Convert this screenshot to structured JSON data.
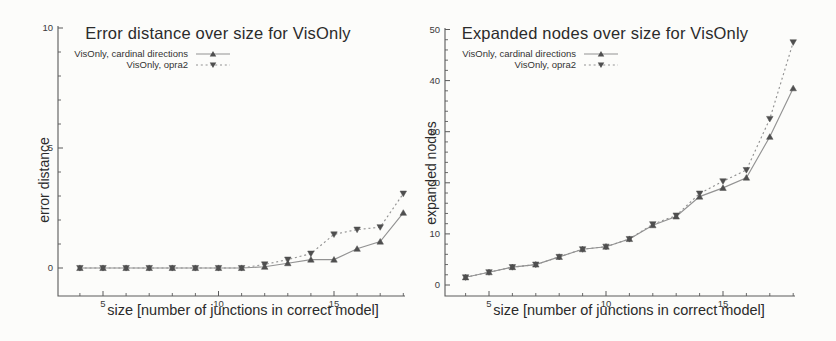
{
  "page": {
    "background_color": "#fcfcfa",
    "axis_color": "#5a5a5a",
    "tick_label_color": "#3a3a3a"
  },
  "chart_data": [
    {
      "type": "line",
      "title": "Error distance over size for VisOnly",
      "xlabel": "size [number of junctions in correct model]",
      "ylabel": "error distance",
      "x": [
        4,
        5,
        6,
        7,
        8,
        9,
        10,
        11,
        12,
        13,
        14,
        15,
        16,
        17,
        18
      ],
      "series": [
        {
          "name": "VisOnly, cardinal directions",
          "line": "solid",
          "marker": "triangle-down",
          "values": [
            0,
            0,
            0,
            0,
            0,
            0,
            0,
            0,
            0.05,
            0.2,
            0.35,
            0.35,
            0.8,
            1.1,
            2.3
          ]
        },
        {
          "name": "VisOnly, opra2",
          "line": "dotted",
          "marker": "triangle-up",
          "values": [
            0,
            0,
            0,
            0,
            0,
            0,
            0,
            0,
            0.15,
            0.35,
            0.6,
            1.4,
            1.6,
            1.7,
            3.1
          ]
        }
      ],
      "xlim": [
        3,
        18.2
      ],
      "ylim": [
        0,
        10
      ],
      "xticks": [
        5,
        10,
        15
      ],
      "yticks": [
        0,
        5,
        10
      ],
      "x_minor_step": 1,
      "y_minor_step": 1,
      "grid": false,
      "legend_position": "top-left-inside",
      "line_color": "#929292",
      "marker_color": "#4f4f4f"
    },
    {
      "type": "line",
      "title": "Expanded nodes over size for VisOnly",
      "xlabel": "size [number of junctions in correct model]",
      "ylabel": "expanded nodes",
      "x": [
        4,
        5,
        6,
        7,
        8,
        9,
        10,
        11,
        12,
        13,
        14,
        15,
        16,
        17,
        18
      ],
      "series": [
        {
          "name": "VisOnly, cardinal directions",
          "line": "solid",
          "marker": "triangle-down",
          "values": [
            1.5,
            2.5,
            3.5,
            4.0,
            5.5,
            7.0,
            7.5,
            9.0,
            11.7,
            13.4,
            17.3,
            19.0,
            21.0,
            29.0,
            38.5
          ]
        },
        {
          "name": "VisOnly, opra2",
          "line": "dotted",
          "marker": "triangle-up",
          "values": [
            1.5,
            2.5,
            3.5,
            4.0,
            5.5,
            7.0,
            7.5,
            9.0,
            11.9,
            13.6,
            17.9,
            20.3,
            22.5,
            32.5,
            47.5
          ]
        }
      ],
      "xlim": [
        3,
        18.2
      ],
      "ylim": [
        0,
        50
      ],
      "xticks": [
        5,
        10,
        15
      ],
      "yticks": [
        0,
        10,
        20,
        30,
        40,
        50
      ],
      "x_minor_step": 1,
      "y_minor_step": 2,
      "grid": false,
      "legend_position": "top-left-inside",
      "line_color": "#929292",
      "marker_color": "#4f4f4f"
    }
  ]
}
